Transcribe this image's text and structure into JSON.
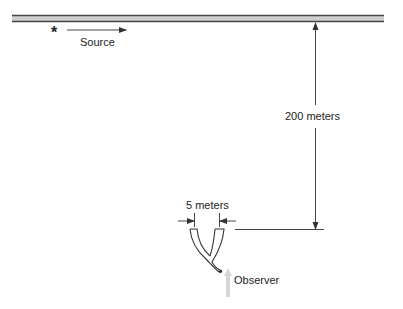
{
  "diagram": {
    "source": {
      "symbol": "*",
      "label": "Source"
    },
    "vertical_distance": {
      "label": "200 meters"
    },
    "horn_width": {
      "label": "5 meters"
    },
    "observer": {
      "label": "Observer"
    }
  },
  "colors": {
    "line": "#333333",
    "band_light": "#cfcfcf",
    "observer_arrow": "#d6d6d6"
  }
}
